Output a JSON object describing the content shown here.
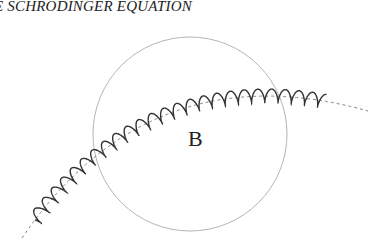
{
  "header": {
    "running_title": "E SCHRODINGER EQUATION"
  },
  "figure": {
    "region_label": "B",
    "circle": {
      "cx": 190,
      "cy": 134,
      "r": 97,
      "stroke": "#b5b5b5"
    },
    "wave": {
      "stroke": "#333333",
      "amplitude": 7,
      "wavelength": 13.5
    },
    "path_dash_color": "#777777"
  }
}
